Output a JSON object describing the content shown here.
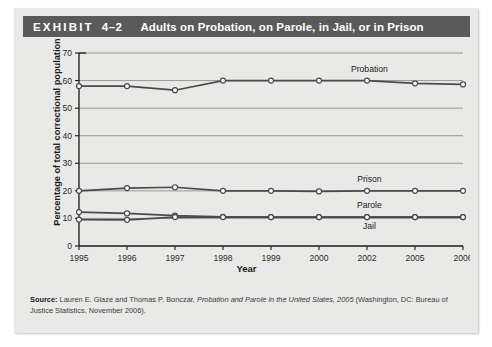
{
  "exhibit": {
    "label": "EXHIBIT",
    "number": "4–2",
    "title": "Adults on Probation, on Parole, in Jail, or in Prison"
  },
  "source": {
    "label": "Source:",
    "text_before_italic": " Lauren E. Glaze and Thomas P. Bonczar, ",
    "italic_text": "Probation and Parole in the United States, 2005",
    "text_after_italic": " (Washington, DC: Bureau of Justice Statistics, November 2006)."
  },
  "colors": {
    "header_bar": "#5a5a5a",
    "card_background": "#e9e9e7",
    "line": "#4a4a4a",
    "marker_fill": "#ffffff",
    "axis": "#1a1a1a"
  },
  "chart_data": {
    "type": "line",
    "title": "Adults on Probation, on Parole, in Jail, or in Prison",
    "xlabel": "Year",
    "ylabel": "Percentage of total correctional population",
    "categories": [
      "1995",
      "1996",
      "1997",
      "1998",
      "1999",
      "2000",
      "2002",
      "2005",
      "2006"
    ],
    "ylim": [
      0,
      70
    ],
    "yticks": [
      0,
      10,
      20,
      30,
      40,
      50,
      60,
      70
    ],
    "grid": true,
    "legend": "inline-labels",
    "series": [
      {
        "name": "Probation",
        "values": [
          58.0,
          58.0,
          56.5,
          60.0,
          60.0,
          60.0,
          60.0,
          59.0,
          58.6
        ]
      },
      {
        "name": "Prison",
        "values": [
          20.0,
          21.0,
          21.3,
          20.0,
          20.0,
          19.8,
          20.0,
          20.0,
          20.0
        ]
      },
      {
        "name": "Parole",
        "values": [
          12.3,
          11.8,
          11.0,
          10.6,
          10.5,
          10.5,
          10.5,
          10.5,
          10.5
        ]
      },
      {
        "name": "Jail",
        "values": [
          9.6,
          9.5,
          10.5,
          10.5,
          10.5,
          10.5,
          10.5,
          10.5,
          10.5
        ]
      }
    ]
  }
}
